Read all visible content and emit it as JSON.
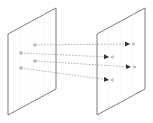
{
  "diagram": {
    "title": "",
    "colors": {
      "plane_stroke": "#6b6b6b",
      "plane_fill": "#ffffff",
      "grid": "#eeeeee",
      "arrow": "#9a9a9a",
      "arrowhead": "#333333",
      "point": "#777777"
    },
    "planes": [
      {
        "id": "left-plane",
        "label": ""
      },
      {
        "id": "right-plane",
        "label": ""
      }
    ],
    "connections": [
      {
        "from": "source-point-1",
        "to": "target-point-1"
      },
      {
        "from": "source-point-2",
        "to": "target-point-2"
      },
      {
        "from": "source-point-3",
        "to": "target-point-3"
      },
      {
        "from": "source-point-4",
        "to": "target-point-4"
      }
    ]
  }
}
